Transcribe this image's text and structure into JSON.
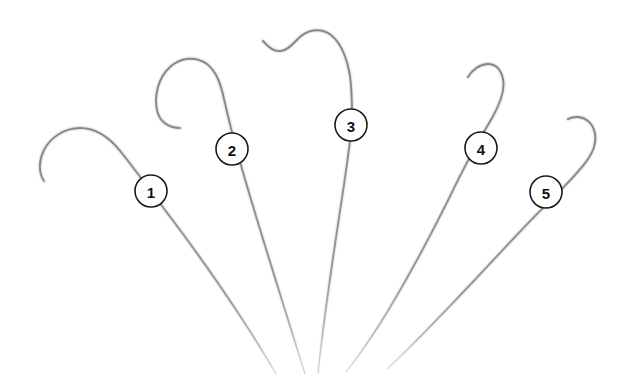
{
  "figure": {
    "title": "Five numbered hook instruments",
    "background_color": "#ffffff",
    "width": 632,
    "height": 390,
    "stroke_color": "#9a9a9a",
    "highlight_color": "#c9c9c9",
    "core_color": "#6f6f6f",
    "label_text_color": "#111111",
    "label_circle_fill": "#ffffff",
    "label_circle_stroke": "#1a1a1a"
  },
  "callouts": [
    {
      "id": 1,
      "label": "1",
      "cx": 151,
      "cy": 191,
      "r": 16
    },
    {
      "id": 2,
      "label": "2",
      "cx": 232,
      "cy": 149,
      "r": 16
    },
    {
      "id": 3,
      "label": "3",
      "cx": 351,
      "cy": 125,
      "r": 16
    },
    {
      "id": 4,
      "label": "4",
      "cx": 481,
      "cy": 148,
      "r": 16
    },
    {
      "id": 5,
      "label": "5",
      "cx": 546,
      "cy": 192,
      "r": 16
    }
  ],
  "instruments": [
    {
      "id": 1,
      "name": "hook-1",
      "label": "1",
      "tip_style": "wide-squared-hook",
      "path": "M 44 181 C 38 172 39 160 44 150 C 50 138 64 128 80 128 C 96 128 110 138 121 152 C 133 167 150 190 168 214 C 200 256 245 320 276 374",
      "stroke_width": 2.0
    },
    {
      "id": 2,
      "name": "hook-2",
      "label": "2",
      "tip_style": "narrow-j-hook",
      "path": "M 180 128 C 168 128 159 121 157 110 C 154 96 158 78 170 67 C 181 57 196 56 207 64 C 217 72 221 85 224 99 C 228 116 233 138 239 158 C 252 206 282 300 305 374",
      "stroke_width": 2.0
    },
    {
      "id": 3,
      "name": "hook-3",
      "label": "3",
      "tip_style": "s-curve-open-hook",
      "path": "M 263 41 C 268 47 274 52 281 51 C 289 50 294 42 301 36 C 310 29 322 28 331 35 C 341 43 347 58 350 76 C 352 90 352 104 352 118 C 352 148 330 260 318 373",
      "stroke_width": 2.0
    },
    {
      "id": 4,
      "name": "hook-4",
      "label": "4",
      "tip_style": "small-shepherd-hook",
      "path": "M 468 77 C 472 70 480 64 488 64 C 496 64 501 70 503 79 C 505 89 500 104 492 118 C 482 135 470 156 458 180 C 443 211 423 250 403 285 C 385 317 362 352 346 372",
      "stroke_width": 2.0
    },
    {
      "id": 5,
      "name": "hook-5",
      "label": "5",
      "tip_style": "s-curve-tip",
      "path": "M 568 119 C 574 116 582 116 588 121 C 595 127 597 137 594 147 C 591 157 583 166 575 175 C 566 185 552 199 538 213 C 505 246 440 320 387 369",
      "stroke_width": 2.0
    }
  ]
}
